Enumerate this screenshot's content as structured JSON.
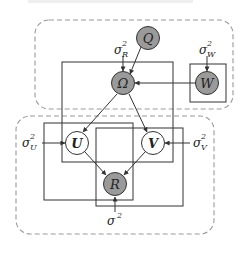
{
  "caption": "Graphical model of the proposed probabilistic matrix factorization",
  "colors": {
    "observed_fill": "#9a9a9a",
    "latent_fill": "#ffffff",
    "stroke": "#333333",
    "group_dash": "#9a9a9a"
  },
  "nodes": {
    "Q": {
      "label": "Q",
      "type": "observed"
    },
    "Omega": {
      "label": "Ω",
      "type": "observed"
    },
    "W": {
      "label": "W",
      "type": "observed"
    },
    "U": {
      "label": "U",
      "type": "latent"
    },
    "V": {
      "label": "V",
      "type": "latent"
    },
    "R": {
      "label": "R",
      "type": "observed"
    }
  },
  "hyperparameters": {
    "sigma_R": {
      "base": "σ",
      "sup": "2",
      "sub": "R"
    },
    "sigma_W": {
      "base": "σ",
      "sup": "2",
      "sub": "W"
    },
    "sigma_U": {
      "base": "σ",
      "sup": "2",
      "sub": "U"
    },
    "sigma_V": {
      "base": "σ",
      "sup": "2",
      "sub": "V"
    },
    "sigma": {
      "base": "σ",
      "sup": "2"
    }
  },
  "edges": [
    [
      "Q",
      "Omega"
    ],
    [
      "sigma_R",
      "Omega"
    ],
    [
      "W",
      "Omega"
    ],
    [
      "sigma_W",
      "W"
    ],
    [
      "Omega",
      "U"
    ],
    [
      "Omega",
      "V"
    ],
    [
      "sigma_U",
      "U"
    ],
    [
      "sigma_V",
      "V"
    ],
    [
      "U",
      "R"
    ],
    [
      "V",
      "R"
    ],
    [
      "sigma",
      "R"
    ]
  ]
}
